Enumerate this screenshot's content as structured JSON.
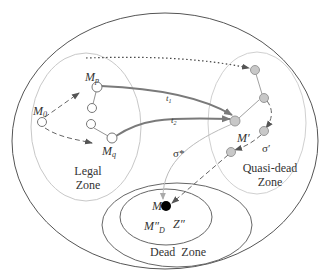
{
  "diagram": {
    "colors": {
      "outer_ellipse": "#555555",
      "zone_ellipse": "#cccccc",
      "dead_zone_ellipse": "#666666",
      "path_line": "#808080",
      "legal_node_fill": "#ffffff",
      "quasi_node_fill": "#c8c8c8",
      "dead_marking_fill": "#000000"
    },
    "zones": {
      "legal": {
        "line1": "Legal",
        "line2": "Zone"
      },
      "quasi_dead": {
        "line1": "Quasi-dead",
        "line2": "Zone"
      },
      "dead": {
        "label": "Dead  Zone"
      }
    },
    "markings": {
      "m0": {
        "base": "M",
        "sub": "0"
      },
      "mp": {
        "base": "M",
        "sub": "p"
      },
      "mq": {
        "base": "M",
        "sub": "q"
      },
      "m_prime": "M′",
      "m_dead": "M",
      "m_dd": {
        "base": "M″",
        "sub": "D"
      },
      "z": "Z″"
    },
    "transitions": {
      "t1": {
        "base": "t",
        "sub": "1"
      },
      "t2": {
        "base": "t",
        "sub": "2"
      }
    },
    "sequences": {
      "sigma_star": "σ*",
      "sigma_prime": "σ′"
    },
    "icons": {
      "legal_node": "hollow-circle",
      "quasi_node": "gray-filled-circle",
      "dead_node": "black-filled-circle",
      "arrow": "arrowhead"
    }
  }
}
